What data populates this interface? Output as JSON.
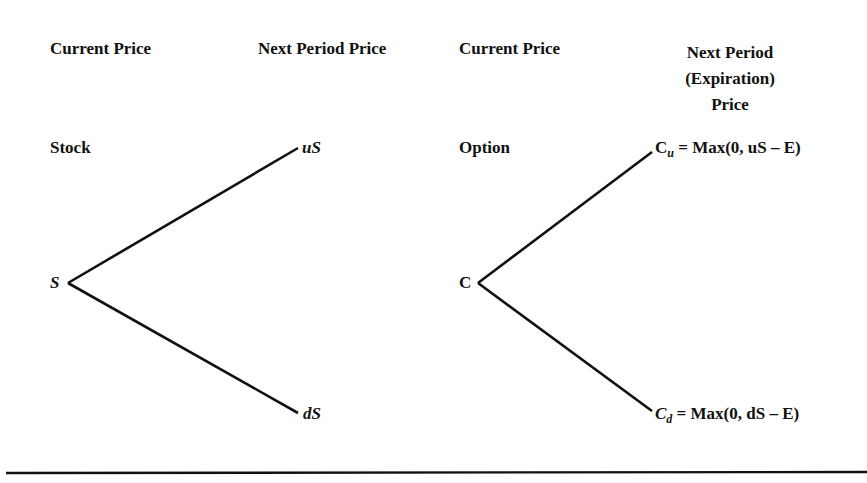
{
  "stock_tree": {
    "header_current": "Current Price",
    "header_next": "Next Period Price",
    "row_label": "Stock",
    "root": "S",
    "up": "uS",
    "down": "dS"
  },
  "option_tree": {
    "header_current": "Current Price",
    "header_next_line1": "Next Period",
    "header_next_line2": "(Expiration)",
    "header_next_line3": "Price",
    "row_label": "Option",
    "root": "C",
    "up_symbol": "C",
    "up_sub": "u",
    "up_formula": "= Max(0, uS – E)",
    "down_symbol": "C",
    "down_sub": "d",
    "down_formula": "= Max(0, dS – E)"
  }
}
